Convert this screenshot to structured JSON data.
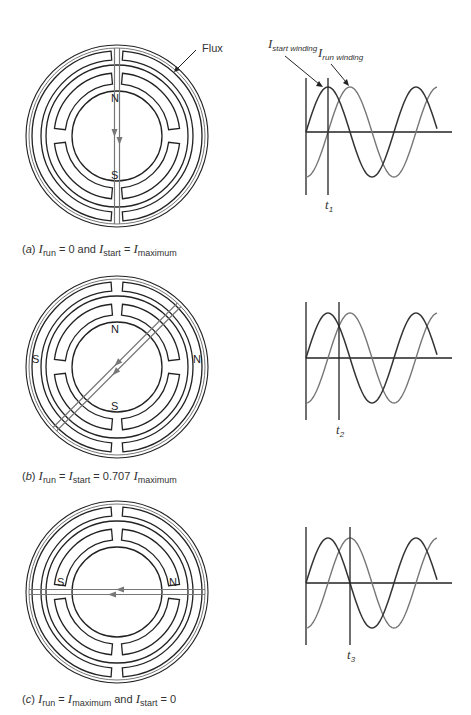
{
  "annotations": {
    "flux_label": "Flux",
    "start_winding_I": "I",
    "start_winding_sub": "start winding",
    "run_winding_I": "I",
    "run_winding_sub": "run winding"
  },
  "panels": [
    {
      "id": "a",
      "poles": {
        "top": "N",
        "bottom": "S"
      },
      "flux_angle_deg": 90,
      "time_marker": {
        "t": "t",
        "sub": "1"
      },
      "caption": {
        "tag": "(a)",
        "parts": [
          "I",
          "run",
          " = 0   and  ",
          "I",
          "start",
          " = ",
          "I",
          "maximum"
        ]
      }
    },
    {
      "id": "b",
      "poles": {
        "top": "N",
        "bottom": "S",
        "left": "S",
        "right": "N"
      },
      "flux_angle_deg": 45,
      "time_marker": {
        "t": "t",
        "sub": "2"
      },
      "caption": {
        "tag": "(b)",
        "parts": [
          "I",
          "run",
          " = ",
          "I",
          "start",
          " = 0.707 ",
          "I",
          "maximum"
        ]
      }
    },
    {
      "id": "c",
      "poles": {
        "left": "S",
        "right": "N"
      },
      "flux_angle_deg": 0,
      "time_marker": {
        "t": "t",
        "sub": "3"
      },
      "caption": {
        "tag": "(c)",
        "parts": [
          "I",
          "run",
          " = ",
          "I",
          "maximum",
          "  and  ",
          "I",
          "start",
          " = 0"
        ]
      }
    }
  ],
  "colors": {
    "stator_line": "#222222",
    "flux_line": "#777777",
    "start_wave": "#333333",
    "run_wave": "#777777"
  },
  "chart_data": {
    "type": "line",
    "series": [
      {
        "name": "I start winding",
        "phase_deg": 0,
        "form": "sin"
      },
      {
        "name": "I run winding",
        "phase_deg": -90,
        "form": "-cos"
      }
    ],
    "x_cycles": 1.25,
    "markers": [
      {
        "label": "t1",
        "phase_deg": 90,
        "I_start": 1.0,
        "I_run": 0.0
      },
      {
        "label": "t2",
        "phase_deg": 135,
        "I_start": 0.707,
        "I_run": 0.707
      },
      {
        "label": "t3",
        "phase_deg": 180,
        "I_start": 0.0,
        "I_run": 1.0
      }
    ]
  }
}
